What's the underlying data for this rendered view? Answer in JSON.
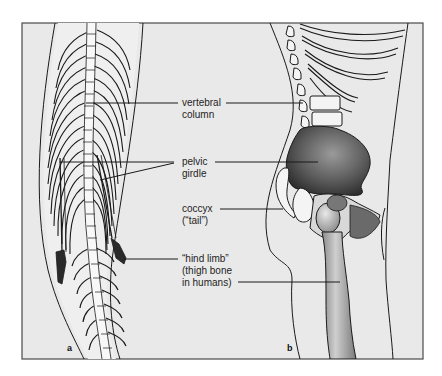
{
  "figure": {
    "panels": [
      {
        "id": "a",
        "letter": "a",
        "subject": "snake skeleton"
      },
      {
        "id": "b",
        "letter": "b",
        "subject": "human skeleton"
      }
    ],
    "labels": {
      "vertebral_column": {
        "line1": "vertebral",
        "line2": "column"
      },
      "pelvic_girdle": {
        "line1": "pelvic",
        "line2": "girdle"
      },
      "coccyx": {
        "line1": "coccyx",
        "line2": "(“tail”)"
      },
      "hind_limb": {
        "line1": "“hind limb”",
        "line2": "(thigh bone",
        "line3": "in humans)"
      }
    },
    "colors": {
      "background": "#e9e9e9",
      "frame": "#4a4a4a",
      "bone": "#f4f4f4",
      "ink": "#1a1a1a",
      "pelvis_shade": "#555555"
    }
  }
}
